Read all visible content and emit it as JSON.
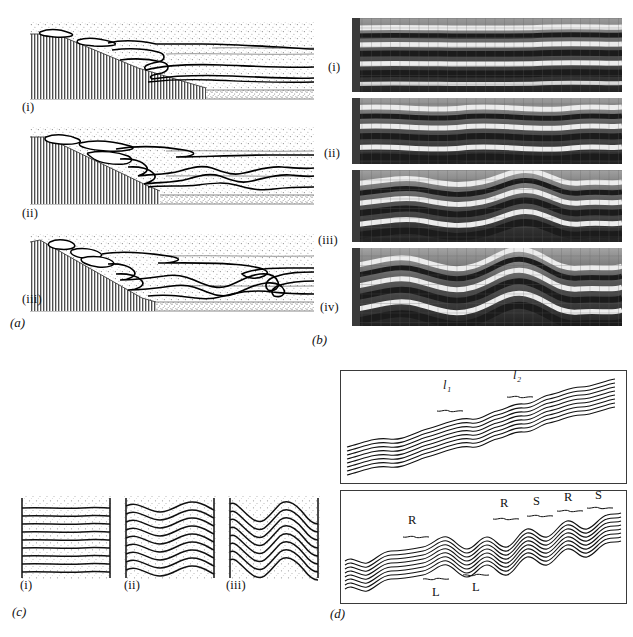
{
  "figure": {
    "domain": "scientific-plate",
    "background": "#ffffff",
    "ink": "#111111",
    "panels": [
      {
        "id": "a",
        "label": "(a)",
        "caption_position": "below-left"
      },
      {
        "id": "b",
        "label": "(b)",
        "caption_position": "below-left"
      },
      {
        "id": "c",
        "label": "(c)",
        "caption_position": "below-left"
      },
      {
        "id": "d",
        "label": "(d)",
        "caption_position": "below-left"
      }
    ]
  },
  "panel_a": {
    "label": "(a)",
    "description": "Three stages of a thrust-wedge / detachment-fold cross-section with stippled sediment, thin marker horizons and a vertically hatched basement wedge on the left.",
    "stages": [
      {
        "label": "(i)",
        "stage_index": 1
      },
      {
        "label": "(ii)",
        "stage_index": 2
      },
      {
        "label": "(iii)",
        "stage_index": 3
      }
    ],
    "colors": {
      "stipple": "#8d8d8d",
      "basement_hatch": "#4a4a4a",
      "horizon_line": "#111111",
      "bold_fold_line": "#000000"
    }
  },
  "panel_b": {
    "label": "(b)",
    "description": "Four greyscale photographs of an analogue multilayer experiment with a square grid overlay, showing progressive buckle-fold amplification.",
    "stages": [
      {
        "label": "(i)",
        "stage_index": 1,
        "amplitude": 2
      },
      {
        "label": "(ii)",
        "stage_index": 2,
        "amplitude": 5
      },
      {
        "label": "(iii)",
        "stage_index": 3,
        "amplitude": 11
      },
      {
        "label": "(iv)",
        "stage_index": 4,
        "amplitude": 16
      }
    ],
    "colors": {
      "dark_band": "#1b1b1b",
      "light_band": "#e8e8e8",
      "mid_band": "#9a9a9a",
      "grid": "#555555"
    }
  },
  "panel_c": {
    "label": "(c)",
    "description": "Three stages of progressive buckling of a multilayer stack between two rigid vertical walls; wavelength constant, amplitude increasing.",
    "stages": [
      {
        "label": "(i)",
        "stage_index": 1,
        "amplitude": 1.5,
        "cycles": 2.0
      },
      {
        "label": "(ii)",
        "stage_index": 2,
        "amplitude": 7.0,
        "cycles": 2.0
      },
      {
        "label": "(iii)",
        "stage_index": 3,
        "amplitude": 15.0,
        "cycles": 2.0
      }
    ],
    "layers": 9,
    "colors": {
      "stipple": "#9a9a9a",
      "layer_line": "#111111",
      "wall_line": "#111111"
    }
  },
  "panel_d": {
    "label": "(d)",
    "description": "Two framed line drawings of an inclined multilayer fold train; the upper box marks two wavelength domains, the lower box marks right-facing, symmetric and left-facing fold packets.",
    "boxes": [
      {
        "box_index": 1,
        "annotations": [
          {
            "text": "l₁",
            "position": "upper",
            "x_frac": 0.38,
            "kind": "wavelength-bracket"
          },
          {
            "text": "l₂",
            "position": "upper",
            "x_frac": 0.63,
            "kind": "wavelength-bracket"
          }
        ]
      },
      {
        "box_index": 2,
        "annotations": [
          {
            "text": "R",
            "position": "upper",
            "x_frac": 0.23,
            "kind": "vergence-bracket"
          },
          {
            "text": "R",
            "position": "upper",
            "x_frac": 0.55,
            "kind": "vergence-bracket"
          },
          {
            "text": "S",
            "position": "upper",
            "x_frac": 0.685,
            "kind": "vergence-bracket"
          },
          {
            "text": "R",
            "position": "upper",
            "x_frac": 0.795,
            "kind": "vergence-bracket"
          },
          {
            "text": "S",
            "position": "upper",
            "x_frac": 0.895,
            "kind": "vergence-bracket"
          },
          {
            "text": "L",
            "position": "lower",
            "x_frac": 0.345,
            "kind": "vergence-bracket"
          },
          {
            "text": "L",
            "position": "lower",
            "x_frac": 0.475,
            "kind": "vergence-bracket"
          }
        ]
      }
    ],
    "layers": 10,
    "colors": {
      "frame": "#3a3a3a",
      "layer_line": "#111111",
      "annotation": "#111111"
    }
  }
}
